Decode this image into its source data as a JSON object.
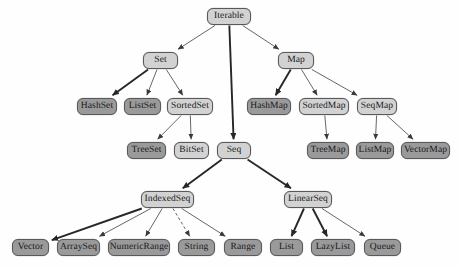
{
  "diagram": {
    "type": "tree",
    "background": "#fefefe",
    "colors": {
      "light_node": "#d2d2d2",
      "dark_node": "#9a9a9a",
      "node_border": "#59595c",
      "edge": "#3a3a3a"
    },
    "nodes": [
      {
        "id": "Iterable",
        "label": "Iterable",
        "shade": "light",
        "x": 207,
        "y": 8,
        "w": 44,
        "h": 17
      },
      {
        "id": "Set",
        "label": "Set",
        "shade": "light",
        "x": 143,
        "y": 52,
        "w": 35,
        "h": 17
      },
      {
        "id": "Map",
        "label": "Map",
        "shade": "light",
        "x": 278,
        "y": 52,
        "w": 36,
        "h": 17
      },
      {
        "id": "HashSet",
        "label": "HashSet",
        "shade": "dark",
        "x": 77,
        "y": 98,
        "w": 40,
        "h": 17
      },
      {
        "id": "ListSet",
        "label": "ListSet",
        "shade": "dark",
        "x": 124,
        "y": 98,
        "w": 37,
        "h": 17
      },
      {
        "id": "SortedSet",
        "label": "SortedSet",
        "shade": "light",
        "x": 167,
        "y": 98,
        "w": 46,
        "h": 17
      },
      {
        "id": "HashMap",
        "label": "HashMap",
        "shade": "dark",
        "x": 247,
        "y": 98,
        "w": 44,
        "h": 17
      },
      {
        "id": "SortedMap",
        "label": "SortedMap",
        "shade": "light",
        "x": 299,
        "y": 98,
        "w": 50,
        "h": 17
      },
      {
        "id": "SeqMap",
        "label": "SeqMap",
        "shade": "light",
        "x": 357,
        "y": 98,
        "w": 40,
        "h": 17
      },
      {
        "id": "TreeSet",
        "label": "TreeSet",
        "shade": "dark",
        "x": 127,
        "y": 142,
        "w": 39,
        "h": 17
      },
      {
        "id": "BitSet",
        "label": "BitSet",
        "shade": "light",
        "x": 174,
        "y": 142,
        "w": 35,
        "h": 17
      },
      {
        "id": "Seq",
        "label": "Seq",
        "shade": "light",
        "x": 217,
        "y": 142,
        "w": 34,
        "h": 17
      },
      {
        "id": "TreeMap",
        "label": "TreeMap",
        "shade": "dark",
        "x": 307,
        "y": 142,
        "w": 42,
        "h": 17
      },
      {
        "id": "ListMap",
        "label": "ListMap",
        "shade": "dark",
        "x": 356,
        "y": 142,
        "w": 38,
        "h": 17
      },
      {
        "id": "VectorMap",
        "label": "VectorMap",
        "shade": "dark",
        "x": 401,
        "y": 142,
        "w": 49,
        "h": 17
      },
      {
        "id": "IndexedSeq",
        "label": "IndexedSeq",
        "shade": "light",
        "x": 141,
        "y": 191,
        "w": 53,
        "h": 17
      },
      {
        "id": "LinearSeq",
        "label": "LinearSeq",
        "shade": "light",
        "x": 284,
        "y": 191,
        "w": 48,
        "h": 17
      },
      {
        "id": "Vector",
        "label": "Vector",
        "shade": "dark",
        "x": 12,
        "y": 239,
        "w": 37,
        "h": 17
      },
      {
        "id": "ArraySeq",
        "label": "ArraySeq",
        "shade": "dark",
        "x": 57,
        "y": 239,
        "w": 43,
        "h": 17
      },
      {
        "id": "NumericRange",
        "label": "NumericRange",
        "shade": "dark",
        "x": 108,
        "y": 239,
        "w": 62,
        "h": 17
      },
      {
        "id": "String",
        "label": "String",
        "shade": "dark",
        "x": 178,
        "y": 239,
        "w": 37,
        "h": 17
      },
      {
        "id": "Range",
        "label": "Range",
        "shade": "dark",
        "x": 224,
        "y": 239,
        "w": 38,
        "h": 17
      },
      {
        "id": "List",
        "label": "List",
        "shade": "dark",
        "x": 270,
        "y": 239,
        "w": 33,
        "h": 17
      },
      {
        "id": "LazyList",
        "label": "LazyList",
        "shade": "dark",
        "x": 311,
        "y": 239,
        "w": 44,
        "h": 17
      },
      {
        "id": "Queue",
        "label": "Queue",
        "shade": "dark",
        "x": 364,
        "y": 239,
        "w": 37,
        "h": 17
      }
    ],
    "edges": [
      {
        "from": "Iterable",
        "to": "Set",
        "style": "solid",
        "weight": "thin"
      },
      {
        "from": "Iterable",
        "to": "Seq",
        "style": "solid",
        "weight": "thick"
      },
      {
        "from": "Iterable",
        "to": "Map",
        "style": "solid",
        "weight": "thin"
      },
      {
        "from": "Set",
        "to": "HashSet",
        "style": "solid",
        "weight": "thick"
      },
      {
        "from": "Set",
        "to": "ListSet",
        "style": "solid",
        "weight": "thin"
      },
      {
        "from": "Set",
        "to": "SortedSet",
        "style": "solid",
        "weight": "thin"
      },
      {
        "from": "Map",
        "to": "HashMap",
        "style": "solid",
        "weight": "thick"
      },
      {
        "from": "Map",
        "to": "SortedMap",
        "style": "solid",
        "weight": "thin"
      },
      {
        "from": "Map",
        "to": "SeqMap",
        "style": "solid",
        "weight": "thin"
      },
      {
        "from": "SortedSet",
        "to": "TreeSet",
        "style": "solid",
        "weight": "thin"
      },
      {
        "from": "SortedSet",
        "to": "BitSet",
        "style": "solid",
        "weight": "thin"
      },
      {
        "from": "SortedMap",
        "to": "TreeMap",
        "style": "solid",
        "weight": "thin"
      },
      {
        "from": "SeqMap",
        "to": "ListMap",
        "style": "solid",
        "weight": "thin"
      },
      {
        "from": "SeqMap",
        "to": "VectorMap",
        "style": "solid",
        "weight": "thin"
      },
      {
        "from": "Seq",
        "to": "IndexedSeq",
        "style": "solid",
        "weight": "thick"
      },
      {
        "from": "Seq",
        "to": "LinearSeq",
        "style": "solid",
        "weight": "thick"
      },
      {
        "from": "IndexedSeq",
        "to": "Vector",
        "style": "solid",
        "weight": "thick"
      },
      {
        "from": "IndexedSeq",
        "to": "ArraySeq",
        "style": "solid",
        "weight": "thin"
      },
      {
        "from": "IndexedSeq",
        "to": "NumericRange",
        "style": "solid",
        "weight": "thin"
      },
      {
        "from": "IndexedSeq",
        "to": "String",
        "style": "dashed",
        "weight": "thin"
      },
      {
        "from": "IndexedSeq",
        "to": "Range",
        "style": "solid",
        "weight": "thin"
      },
      {
        "from": "LinearSeq",
        "to": "List",
        "style": "solid",
        "weight": "thick"
      },
      {
        "from": "LinearSeq",
        "to": "LazyList",
        "style": "solid",
        "weight": "thick"
      },
      {
        "from": "LinearSeq",
        "to": "Queue",
        "style": "solid",
        "weight": "thin"
      }
    ]
  }
}
